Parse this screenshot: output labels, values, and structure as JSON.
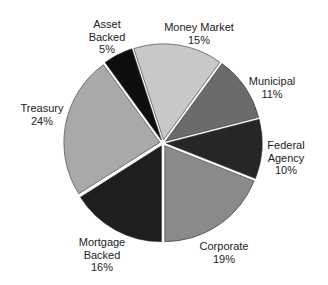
{
  "chart_data": {
    "type": "pie",
    "title": "",
    "start_angle_deg": 180,
    "direction": "clockwise",
    "categories": [
      "Mortgage Backed",
      "Treasury",
      "Asset Backed",
      "Money Market",
      "Municipal",
      "Federal Agency",
      "Corporate"
    ],
    "values": [
      16,
      24,
      5,
      15,
      11,
      10,
      19
    ],
    "unit": "%",
    "colors": [
      "#1e1e1e",
      "#a9a9a9",
      "#0d0d0d",
      "#c8c8c8",
      "#6b6b6b",
      "#262626",
      "#8a8a8a"
    ],
    "exploded": true,
    "legend": "none",
    "labels": [
      {
        "lines": [
          "Mortgage",
          "Backed",
          "16%"
        ]
      },
      {
        "lines": [
          "Treasury",
          "24%"
        ]
      },
      {
        "lines": [
          "Asset",
          "Backed",
          "5%"
        ]
      },
      {
        "lines": [
          "Money Market",
          "15%"
        ]
      },
      {
        "lines": [
          "Municipal",
          "11%"
        ]
      },
      {
        "lines": [
          "Federal",
          "Agency",
          "10%"
        ]
      },
      {
        "lines": [
          "Corporate",
          "19%"
        ]
      }
    ]
  },
  "labels": {
    "mortgage": {
      "l1": "Mortgage",
      "l2": "Backed",
      "l3": "16%"
    },
    "treasury": {
      "l1": "Treasury",
      "l2": "24%"
    },
    "asset": {
      "l1": "Asset",
      "l2": "Backed",
      "l3": "5%"
    },
    "money": {
      "l1": "Money Market",
      "l2": "15%"
    },
    "municipal": {
      "l1": "Municipal",
      "l2": "11%"
    },
    "federal": {
      "l1": "Federal",
      "l2": "Agency",
      "l3": "10%"
    },
    "corporate": {
      "l1": "Corporate",
      "l2": "19%"
    }
  }
}
